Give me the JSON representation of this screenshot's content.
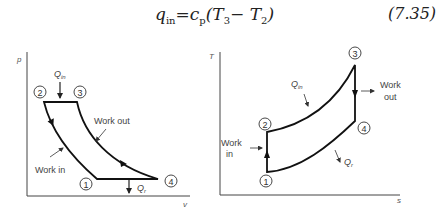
{
  "equation": {
    "lhs_base": "q",
    "lhs_sub": "in",
    "equals": "=",
    "rhs_coef": "c",
    "rhs_coef_sub": "p",
    "rhs_open": "(T",
    "rhs_t3_sub": "3",
    "rhs_minus": "− T",
    "rhs_t2_sub": "2",
    "rhs_close": ")",
    "number": "(7.35)"
  },
  "pv_diagram": {
    "y_axis_label": "p",
    "x_axis_label": "v",
    "states": [
      "1",
      "2",
      "3",
      "4"
    ],
    "q_in_label": "Q",
    "q_in_sub": "in",
    "q_r_label": "Q",
    "q_r_sub": "r",
    "work_out_label": "Work out",
    "work_in_label": "Work in"
  },
  "ts_diagram": {
    "y_axis_label": "T",
    "x_axis_label": "s",
    "states": [
      "1",
      "2",
      "3",
      "4"
    ],
    "q_in_label": "Q",
    "q_in_sub": "in",
    "q_r_label": "Q",
    "q_r_sub": "r",
    "work_out_line1": "Work",
    "work_out_line2": "out",
    "work_in_line1": "Work",
    "work_in_line2": "in"
  }
}
